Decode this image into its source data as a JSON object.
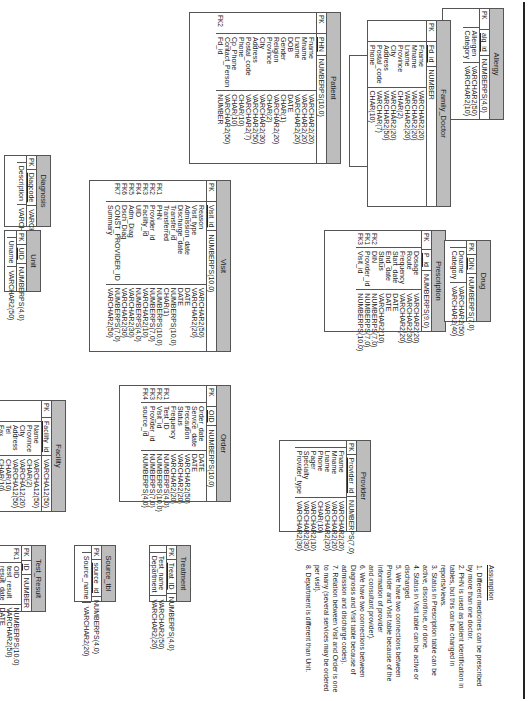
{
  "diagram": {
    "type": "ER diagram",
    "orientation": "rotated 90deg clockwise",
    "tables": [
      {
        "name": "Allergy",
        "pk": [
          {
            "key": "PK",
            "name": "alg_id",
            "type": "NUMBERPS(4,0)"
          }
        ],
        "fields": [
          {
            "key": "",
            "name": "Allergen",
            "type": "VARCHAR2(50)"
          },
          {
            "key": "",
            "name": "Category",
            "type": "VARCHAR2(10)"
          }
        ]
      },
      {
        "name": "Patient_Allergy",
        "pk": [
          {
            "key": "PK",
            "name": "PA_id",
            "type": "NUMBER"
          }
        ],
        "fields": [
          {
            "key": "FK1",
            "name": "alg_id",
            "type": "NUMBERPS(4,0)"
          },
          {
            "key": "FK2",
            "name": "PHN",
            "type": "NUMBERPS(10,0)"
          },
          {
            "key": "",
            "name": "Reaction",
            "type": "VARCHAR2(30)"
          }
        ]
      },
      {
        "name": "Patient",
        "pk": [
          {
            "key": "PK",
            "name": "PHN",
            "type": "NUMBERPS(10,0)"
          }
        ],
        "fields": [
          {
            "key": "",
            "name": "Fname",
            "type": "VARCHAR2(20)"
          },
          {
            "key": "",
            "name": "Mname",
            "type": "VARCHAR2(20)"
          },
          {
            "key": "",
            "name": "Lname",
            "type": "VARCHAR2(20)"
          },
          {
            "key": "",
            "name": "DOB",
            "type": "DATE"
          },
          {
            "key": "",
            "name": "Gender",
            "type": "CHAR(1)"
          },
          {
            "key": "",
            "name": "Religion",
            "type": "VARCHAR2(20)"
          },
          {
            "key": "",
            "name": "Province",
            "type": "CHAR(2)"
          },
          {
            "key": "",
            "name": "City",
            "type": "VARCHAR2(30)"
          },
          {
            "key": "",
            "name": "Address",
            "type": "VARCHAR2(50)"
          },
          {
            "key": "",
            "name": "Postal_code",
            "type": "VARCHAR2(7)"
          },
          {
            "key": "",
            "name": "Phone",
            "type": "CHAR(10)"
          },
          {
            "key": "",
            "name": "Cp_Phone",
            "type": "CHAR(10)"
          },
          {
            "key": "",
            "name": "Contact_Person",
            "type": "VARCHAR2(50)"
          },
          {
            "key": "FK2",
            "name": "Fd_id",
            "type": "NUMBER"
          }
        ]
      },
      {
        "name": "Family_Doctor",
        "pk": [
          {
            "key": "PK",
            "name": "Fd_id",
            "type": "NUMBER"
          }
        ],
        "fields": [
          {
            "key": "",
            "name": "Fname",
            "type": "VARCHAR2(20)"
          },
          {
            "key": "",
            "name": "Mname",
            "type": "VARCHAR2(20)"
          },
          {
            "key": "",
            "name": "Lname",
            "type": "VARCHAR2(20)"
          },
          {
            "key": "",
            "name": "Province",
            "type": "CHAR(2)"
          },
          {
            "key": "",
            "name": "City",
            "type": "VARCHAR2(20)"
          },
          {
            "key": "",
            "name": "Address",
            "type": "VARCHAR2(50)"
          },
          {
            "key": "",
            "name": "Postal_code",
            "type": "VARCHAR(7)"
          },
          {
            "key": "",
            "name": "Phone",
            "type": "CHAR(10)"
          }
        ]
      },
      {
        "name": "Diagnosis",
        "pk": [
          {
            "key": "PK",
            "name": "Diagcode",
            "type": "VARCHAR2(30)"
          }
        ],
        "fields": [
          {
            "key": "",
            "name": "Description",
            "type": "VARCHAR2(80)"
          }
        ]
      },
      {
        "name": "Unit",
        "pk": [
          {
            "key": "PK",
            "name": "UID",
            "type": "NUMBERPS(4,0)"
          }
        ],
        "fields": [
          {
            "key": "",
            "name": "Uname",
            "type": "VARCHAR2(50)"
          }
        ]
      },
      {
        "name": "Visit",
        "pk": [
          {
            "key": "PK",
            "name": "Visit_id",
            "type": "NUMBERPS(10,0)"
          }
        ],
        "fields": [
          {
            "key": "",
            "name": "Reason",
            "type": "VARCHAR2(50)"
          },
          {
            "key": "",
            "name": "Visit_type",
            "type": "VARCHAR2(20)"
          },
          {
            "key": "",
            "name": "Admission_date",
            "type": "DATE"
          },
          {
            "key": "",
            "name": "Discharge_date",
            "type": "DATE"
          },
          {
            "key": "",
            "name": "Transfer_id",
            "type": "NUMBERPS(10,0)"
          },
          {
            "key": "",
            "name": "Transferred",
            "type": "CHAR(1)"
          },
          {
            "key": "FK1",
            "name": "PHN",
            "type": "NUMBERPS(10,0)"
          },
          {
            "key": "FK2",
            "name": "Provider_id",
            "type": "NUMBERPS(7,0)"
          },
          {
            "key": "FK3",
            "name": "Facility_id",
            "type": "VARCHAR2(10)"
          },
          {
            "key": "FK4",
            "name": "UID",
            "type": "NUMBERPS(4,0)"
          },
          {
            "key": "FK5",
            "name": "Adm_Diag",
            "type": "VARCHAR2(30)"
          },
          {
            "key": "FK6",
            "name": "Dsch_Diag",
            "type": "VARCHAR2(30)"
          },
          {
            "key": "FK7",
            "name": "CONST_PROVIDER_ID",
            "type": "NUMBERPS(7,0)"
          },
          {
            "key": "",
            "name": "Summary",
            "type": "VARCHAR2(50)"
          }
        ]
      },
      {
        "name": "Prescription",
        "pk": [
          {
            "key": "PK",
            "name": "P_id",
            "type": "NUMBERPS(9,0)"
          }
        ],
        "fields": [
          {
            "key": "",
            "name": "Dosage",
            "type": "VARCHAR2(20)"
          },
          {
            "key": "",
            "name": "Route",
            "type": "VARCHAR2(30)"
          },
          {
            "key": "",
            "name": "Frequency",
            "type": "VARCHAR2(20)"
          },
          {
            "key": "",
            "name": "Start_date",
            "type": "DATE"
          },
          {
            "key": "",
            "name": "End_date",
            "type": "DATE"
          },
          {
            "key": "",
            "name": "Status",
            "type": "VARCHAR2(10)"
          },
          {
            "key": "FK2",
            "name": "DIN",
            "type": "NUMBERPS(7,0)"
          },
          {
            "key": "FK1",
            "name": "Provider_id",
            "type": "NUMBERPS(7,0)"
          },
          {
            "key": "FK3",
            "name": "Visit_id",
            "type": "NUMBERPS(10,0)"
          }
        ]
      },
      {
        "name": "Drug",
        "pk": [
          {
            "key": "PK",
            "name": "DIN",
            "type": "NUMBERPS(7,0)"
          }
        ],
        "fields": [
          {
            "key": "",
            "name": "Dname",
            "type": "VARCHAR2(50)"
          },
          {
            "key": "",
            "name": "Category",
            "type": "VARCHAR2(40)"
          }
        ]
      },
      {
        "name": "Facility",
        "pk": [
          {
            "key": "PK",
            "name": "Facility_id",
            "type": "VARCHA12(50)"
          }
        ],
        "fields": [
          {
            "key": "",
            "name": "Name",
            "type": "VARCHA12(50)"
          },
          {
            "key": "",
            "name": "Province",
            "type": "CHAR(2)"
          },
          {
            "key": "",
            "name": "City",
            "type": "VARCHA12(20)"
          },
          {
            "key": "",
            "name": "Address",
            "type": "VARCHA12(50)"
          },
          {
            "key": "",
            "name": "Tel",
            "type": "CHAR(10)"
          },
          {
            "key": "",
            "name": "Fax",
            "type": "CHAR(10)"
          }
        ]
      },
      {
        "name": "Order",
        "pk": [
          {
            "key": "PK",
            "name": "OID",
            "type": "NUMBERPS(10,0)"
          }
        ],
        "fields": [
          {
            "key": "",
            "name": "Order_date",
            "type": "DATE"
          },
          {
            "key": "",
            "name": "Service_date",
            "type": "DATE"
          },
          {
            "key": "",
            "name": "Precaution",
            "type": "VARCHAR2(50)"
          },
          {
            "key": "",
            "name": "Status",
            "type": "VARCHAR2(20)"
          },
          {
            "key": "",
            "name": "Frequency",
            "type": "VARCHAR2(20)"
          },
          {
            "key": "FK1",
            "name": "Test_ID",
            "type": "NUMBERPS(4,0)"
          },
          {
            "key": "FK2",
            "name": "Visit_id",
            "type": "NUMBERPS(10,0)"
          },
          {
            "key": "FK3",
            "name": "Provider_id",
            "type": "NUMBERPS(7,0)"
          },
          {
            "key": "FK4",
            "name": "source_id",
            "type": "NUMBERPS(4,0)"
          }
        ]
      },
      {
        "name": "Provider",
        "pk": [
          {
            "key": "PK",
            "name": "Provider_id",
            "type": "NUMBERPS(7,0)"
          }
        ],
        "fields": [
          {
            "key": "",
            "name": "Fname",
            "type": "VARCHAR2(20)"
          },
          {
            "key": "",
            "name": "Mname",
            "type": "VARCHAR2(20)"
          },
          {
            "key": "",
            "name": "Lname",
            "type": "VARCHAR2(20)"
          },
          {
            "key": "",
            "name": "Phone",
            "type": "CHAR(10)"
          },
          {
            "key": "",
            "name": "Pager",
            "type": "VARCHAR2(10)"
          },
          {
            "key": "",
            "name": "Specialty",
            "type": "VARCHAR2(30)"
          },
          {
            "key": "",
            "name": "Provider_type",
            "type": "VARCHAR2(30)"
          }
        ]
      },
      {
        "name": "Test_Result",
        "pk": [
          {
            "key": "PK",
            "name": "ID",
            "type": "NUMBER"
          }
        ],
        "fields": [
          {
            "key": "FK1",
            "name": "OID",
            "type": "NUMBERPS(10,0)"
          },
          {
            "key": "",
            "name": "test_result",
            "type": "VARCHAR2(50)"
          },
          {
            "key": "",
            "name": "result_date",
            "type": "DATE"
          }
        ]
      },
      {
        "name": "Source_tbl",
        "pk": [
          {
            "key": "PK",
            "name": "source_id",
            "type": "NUMBERPS(4,0)"
          }
        ],
        "fields": [
          {
            "key": "",
            "name": "Source_name",
            "type": "VARCHAR2(20)"
          }
        ]
      },
      {
        "name": "Treatment",
        "pk": [
          {
            "key": "PK",
            "name": "Treat_ID",
            "type": "NUMBERPS(4,0)"
          }
        ],
        "fields": [
          {
            "key": "",
            "name": "Test_name",
            "type": "VARCHAR2(50)"
          },
          {
            "key": "",
            "name": "Department",
            "type": "VARCHAR2(20)"
          }
        ]
      }
    ],
    "assumptions": {
      "title": "Assumption",
      "items": [
        "1.  Different medicines can be prescribed by more than one doctor.",
        "2.  PHN is used as patient identification in tables, but this can be changed in reports/views.",
        "3.  Status in Prescription table can be active, discontinue, or done.",
        "4.  Status in Visit table can be active or discharged.",
        "5.  We have two connections between Provider and Visit table  because of the information of provider",
        "     and consultant provider).",
        "6.  We have two connections between Diagnosis and Visit table  because of admission and discharge codes).",
        "7.  Relation between Visit and Order is one to many (several services may be ordered per visit).",
        "8.  Department is different than Unit."
      ]
    }
  }
}
